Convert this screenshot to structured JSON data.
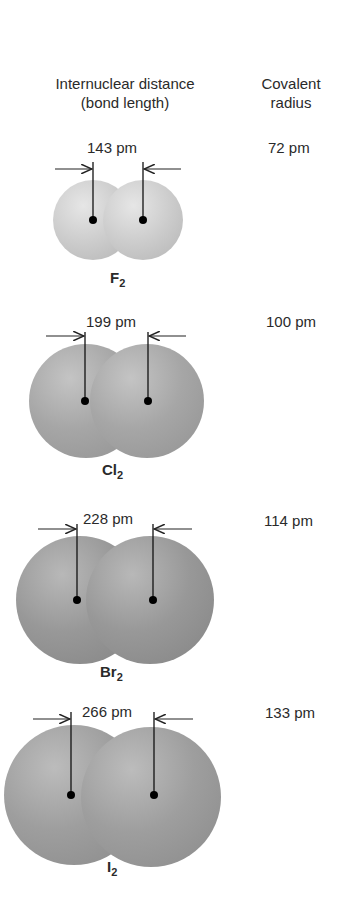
{
  "headers": {
    "bond_length_line1": "Internuclear distance",
    "bond_length_line2": "(bond length)",
    "covalent_radius_line1": "Covalent",
    "covalent_radius_line2": "radius"
  },
  "molecules": [
    {
      "element": "F",
      "subscript": "2",
      "bond_length": "143 pm",
      "covalent_radius": "72 pm"
    },
    {
      "element": "Cl",
      "subscript": "2",
      "bond_length": "199 pm",
      "covalent_radius": "100 pm"
    },
    {
      "element": "Br",
      "subscript": "2",
      "bond_length": "228 pm",
      "covalent_radius": "114 pm"
    },
    {
      "element": "I",
      "subscript": "2",
      "bond_length": "266 pm",
      "covalent_radius": "133 pm"
    }
  ],
  "colors": {
    "F_sphere": "#cfcfcf",
    "Cl_sphere": "#a9a9a9",
    "Br_sphere": "#9c9c9c",
    "I_sphere": "#a2a2a2",
    "nucleus": "#000000",
    "text": "#2a2a2a"
  }
}
